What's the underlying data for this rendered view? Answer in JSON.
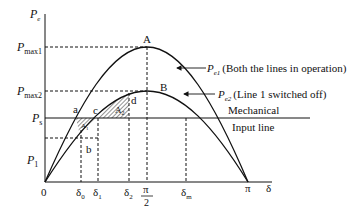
{
  "diagram": {
    "y_axis": {
      "label": "P",
      "label_sub": "e"
    },
    "x_axis": {
      "label": "δ"
    },
    "y_ticks": [
      {
        "id": "pmax1",
        "label": "P",
        "sub": "max1",
        "y": 47
      },
      {
        "id": "pmax2",
        "label": "P",
        "sub": "max2",
        "y": 91
      },
      {
        "id": "ps",
        "label": "P",
        "sub": "s",
        "y": 118
      },
      {
        "id": "p1",
        "label": "P",
        "sub": "1",
        "y": 138
      }
    ],
    "x_ticks": [
      {
        "id": "origin",
        "label": "0",
        "x": 45
      },
      {
        "id": "delta0",
        "label": "δ",
        "sub": "0",
        "x": 81
      },
      {
        "id": "delta1",
        "label": "δ",
        "sub": "1",
        "x": 98
      },
      {
        "id": "delta2",
        "label": "δ",
        "sub": "2",
        "x": 129
      },
      {
        "id": "pi-half",
        "label_num": "π",
        "label_den": "2",
        "x": 147
      },
      {
        "id": "deltam",
        "label": "δ",
        "sub": "m",
        "x": 186
      },
      {
        "id": "pi",
        "label": "π",
        "x": 248
      }
    ],
    "curves": [
      {
        "id": "pe1",
        "label": "P",
        "sub": "e1",
        "description": "(Both the lines in operation)",
        "peak_label": "A",
        "peak_y": 47
      },
      {
        "id": "pe2",
        "label": "P",
        "sub": "e2",
        "description": "(Line 1 switched off)",
        "peak_label": "B",
        "peak_y": 91
      }
    ],
    "mechanical_input": {
      "line1": "Mechanical",
      "line2": "Input line"
    },
    "points": [
      {
        "id": "a",
        "label": "a"
      },
      {
        "id": "b",
        "label": "b"
      },
      {
        "id": "c",
        "label": "c"
      },
      {
        "id": "d",
        "label": "d"
      }
    ],
    "areas": [
      {
        "id": "A1",
        "label": "A",
        "sub": "1"
      },
      {
        "id": "A2",
        "label": "A",
        "sub": "2"
      }
    ],
    "colors": {
      "line": "#111111",
      "background": "#ffffff"
    }
  }
}
